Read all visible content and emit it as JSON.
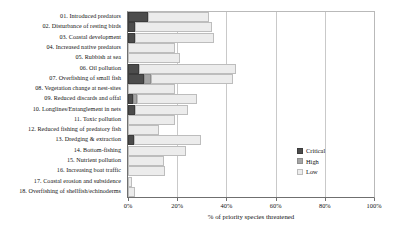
{
  "chart_data": {
    "type": "bar",
    "orientation": "horizontal",
    "stacked": true,
    "title": "",
    "xlabel": "% of priority species threatened",
    "ylabel": "",
    "xlim": [
      0,
      100
    ],
    "xticks": [
      "0%",
      "20%",
      "40%",
      "60%",
      "80%",
      "100%"
    ],
    "xtick_values": [
      0,
      20,
      40,
      60,
      80,
      100
    ],
    "grid": "vertical",
    "legend_position": "middle-right",
    "legend": [
      "Critical",
      "High",
      "Low"
    ],
    "colors": {
      "critical": "#4c4c4c",
      "high": "#a5a5a5",
      "low": "#ececec",
      "axis": "#6f6f6f",
      "gridline": "#c9c9c9"
    },
    "categories": [
      "01. Introduced predators",
      "02. Disturbance of resting birds",
      "03. Coastal development",
      "04. Increased native predators",
      "05. Rubbish at sea",
      "06. Oil pollution",
      "07. Overfishing of small fish",
      "08. Vegetation change at nest-sites",
      "09. Reduced discards and offal",
      "10. Longlines/Entanglement in nets",
      "11. Toxic pollution",
      "12. Reduced fishing of predatory fish",
      "13. Dredging & extraction",
      "14. Bottom-fishing",
      "15. Nutrient pollution",
      "16. Increasing boat traffic",
      "17. Coastal erosion and subsidence",
      "18. Overfishing of shellfish/echinoderms"
    ],
    "series": [
      {
        "name": "Critical",
        "values": [
          8,
          3,
          3,
          0,
          0,
          4.5,
          6.5,
          0,
          2,
          3,
          0,
          0,
          2.5,
          0,
          0,
          0,
          0,
          0
        ]
      },
      {
        "name": "High",
        "values": [
          0,
          0,
          0,
          0,
          0,
          0,
          3,
          0,
          1.5,
          0,
          0,
          0,
          0,
          0,
          0,
          0,
          0,
          0
        ]
      },
      {
        "name": "Low",
        "values": [
          25,
          31,
          32,
          19,
          21,
          39.5,
          33,
          19,
          24.5,
          21.5,
          19,
          12.5,
          27,
          23.5,
          14.5,
          15,
          1.5,
          3
        ]
      }
    ],
    "totals": [
      33,
      34,
      35,
      19,
      21,
      44,
      42.5,
      19,
      28,
      24.5,
      19,
      12.5,
      29.5,
      23.5,
      14.5,
      15,
      1.5,
      3
    ]
  }
}
